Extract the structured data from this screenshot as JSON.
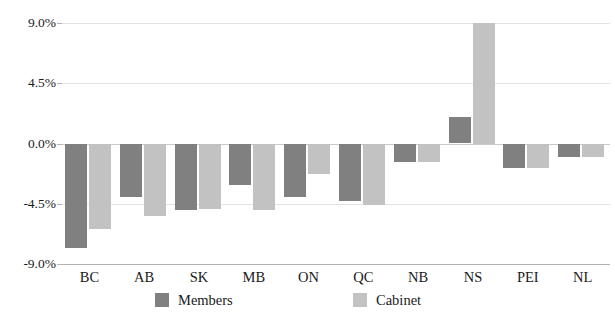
{
  "chart_data": {
    "type": "bar",
    "title": "",
    "xlabel": "",
    "ylabel": "",
    "ylim": [
      -9.0,
      9.0
    ],
    "yticks": [
      "-9.0%",
      "-4.5%",
      "0.0%",
      "4.5%",
      "9.0%"
    ],
    "ytick_values": [
      -9.0,
      -4.5,
      0.0,
      4.5,
      9.0
    ],
    "grid": true,
    "legend_position": "bottom-center",
    "units": "percent",
    "categories": [
      "BC",
      "AB",
      "SK",
      "MB",
      "ON",
      "QC",
      "NB",
      "NS",
      "PEI",
      "NL"
    ],
    "series": [
      {
        "name": "Members",
        "color": "#808080",
        "values": [
          -7.8,
          -4.0,
          -5.0,
          -3.1,
          -4.0,
          -4.3,
          -1.4,
          2.0,
          -1.8,
          -1.0
        ]
      },
      {
        "name": "Cabinet",
        "color": "#c2c2c2",
        "values": [
          -6.4,
          -5.4,
          -4.9,
          -5.0,
          -2.3,
          -4.6,
          -1.4,
          9.0,
          -1.8,
          -1.0
        ]
      }
    ]
  },
  "legend": {
    "entries": [
      {
        "label": "Members"
      },
      {
        "label": "Cabinet"
      }
    ]
  },
  "colors": {
    "members": "#808080",
    "cabinet": "#c2c2c2",
    "gridline": "#e2e2e4",
    "zero_line": "#c9c9cc",
    "axis_line": "#b0b0b4",
    "text": "#1a1a1a",
    "background": "#ffffff"
  }
}
